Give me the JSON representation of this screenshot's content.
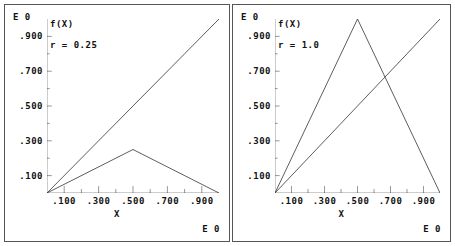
{
  "window": {
    "background_color": "#ffffff",
    "frame_color": "#555555",
    "line_color": "#333333",
    "text_color": "#111111"
  },
  "panels": [
    {
      "id": "panel-left",
      "exponent_top_label": "E 0",
      "exponent_bottom_label": "E 0",
      "function_label": "f(X)",
      "parameter_label": "r = 0.25",
      "x_axis_title": "X",
      "y_ticks": [
        ".900",
        ".700",
        ".500",
        ".300",
        ".100"
      ],
      "x_ticks": [
        ".100",
        ".300",
        ".500",
        ".700",
        ".900"
      ]
    },
    {
      "id": "panel-right",
      "exponent_top_label": "E 0",
      "exponent_bottom_label": "E 0",
      "function_label": "f(X)",
      "parameter_label": "r = 1.0",
      "x_axis_title": "X",
      "y_ticks": [
        ".900",
        ".700",
        ".500",
        ".300",
        ".100"
      ],
      "x_ticks": [
        ".100",
        ".300",
        ".500",
        ".700",
        ".900"
      ]
    }
  ],
  "chart_data": [
    {
      "type": "line",
      "title": "f(X)",
      "annotation": "r = 0.25",
      "xlabel": "X",
      "ylabel": "f(X)",
      "xlim": [
        0.0,
        1.0
      ],
      "ylim": [
        0.0,
        1.0
      ],
      "x_ticks": [
        0.1,
        0.3,
        0.5,
        0.7,
        0.9
      ],
      "x_tick_labels": [
        ".100",
        ".300",
        ".500",
        ".700",
        ".900"
      ],
      "y_ticks": [
        0.1,
        0.3,
        0.5,
        0.7,
        0.9
      ],
      "y_tick_labels": [
        ".100",
        ".300",
        ".500",
        ".700",
        ".900"
      ],
      "grid": false,
      "legend": "none",
      "exponent_label": "E 0",
      "series": [
        {
          "name": "identity",
          "x": [
            0.0,
            1.0
          ],
          "values": [
            0.0,
            1.0
          ]
        },
        {
          "name": "tent-map-r-0.25",
          "x": [
            0.0,
            0.5,
            1.0
          ],
          "values": [
            0.0,
            0.25,
            0.0
          ]
        }
      ]
    },
    {
      "type": "line",
      "title": "f(X)",
      "annotation": "r = 1.0",
      "xlabel": "X",
      "ylabel": "f(X)",
      "xlim": [
        0.0,
        1.0
      ],
      "ylim": [
        0.0,
        1.0
      ],
      "x_ticks": [
        0.1,
        0.3,
        0.5,
        0.7,
        0.9
      ],
      "x_tick_labels": [
        ".100",
        ".300",
        ".500",
        ".700",
        ".900"
      ],
      "y_ticks": [
        0.1,
        0.3,
        0.5,
        0.7,
        0.9
      ],
      "y_tick_labels": [
        ".100",
        ".300",
        ".500",
        ".700",
        ".900"
      ],
      "grid": false,
      "legend": "none",
      "exponent_label": "E 0",
      "series": [
        {
          "name": "identity",
          "x": [
            0.0,
            1.0
          ],
          "values": [
            0.0,
            1.0
          ]
        },
        {
          "name": "tent-map-r-1.0",
          "x": [
            0.0,
            0.5,
            1.0
          ],
          "values": [
            0.0,
            1.0,
            0.0
          ]
        }
      ]
    }
  ]
}
